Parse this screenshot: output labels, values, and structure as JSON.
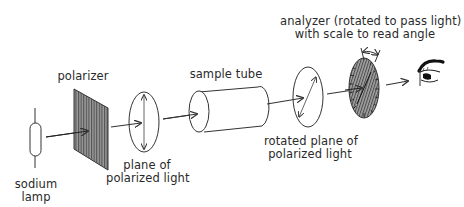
{
  "diagram": {
    "stroke_color": "#333333",
    "fill_dark": "#7a7a7a",
    "components": [
      {
        "id": "sodium_lamp",
        "label_lines": [
          "sodium",
          "lamp"
        ]
      },
      {
        "id": "polarizer",
        "label_lines": [
          "polarizer"
        ]
      },
      {
        "id": "plane_polarized",
        "label_lines": [
          "plane of",
          "polarized light"
        ]
      },
      {
        "id": "sample_tube",
        "label_lines": [
          "sample tube"
        ]
      },
      {
        "id": "rotated_plane",
        "label_lines": [
          "rotated plane of",
          "polarized light"
        ]
      },
      {
        "id": "analyzer",
        "label_lines": [
          "analyzer (rotated to pass light)",
          "with scale to read angle"
        ]
      },
      {
        "id": "eye",
        "label_lines": []
      }
    ],
    "flow": [
      "sodium_lamp",
      "polarizer",
      "plane_polarized",
      "sample_tube",
      "rotated_plane",
      "analyzer",
      "eye"
    ]
  }
}
